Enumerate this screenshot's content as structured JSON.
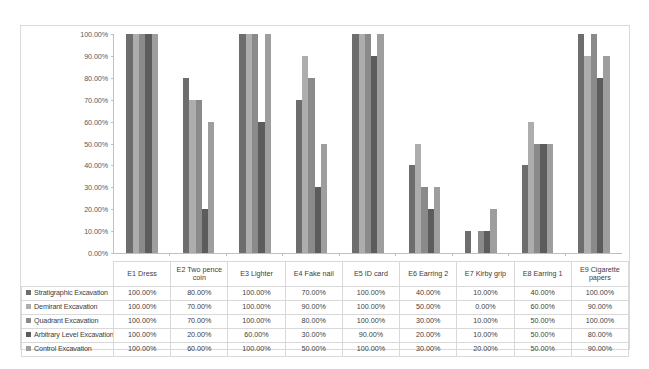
{
  "chart_data": {
    "type": "bar",
    "title": "",
    "xlabel": "",
    "ylabel": "",
    "ylim": [
      0,
      100
    ],
    "ytick_labels": [
      "100.00%",
      "90.00%",
      "80.00%",
      "70.00%",
      "60.00%",
      "50.00%",
      "40.00%",
      "30.00%",
      "20.00%",
      "10.00%",
      "0.00%"
    ],
    "ytick_values": [
      100,
      90,
      80,
      70,
      60,
      50,
      40,
      30,
      20,
      10,
      0
    ],
    "grid": false,
    "legend_position": "data-table-left",
    "value_format": "percent-2dp",
    "categories": [
      "E1 Dress",
      "E2 Two pence coin",
      "E3 Lighter",
      "E4 Fake nail",
      "E5 ID card",
      "E6 Earring 2",
      "E7 Kirby grip",
      "E8 Earring 1",
      "E9 Cigarette papers"
    ],
    "series": [
      {
        "name": "Stratigraphic Excavation",
        "color": "#6d6d6d",
        "values": [
          100,
          80,
          100,
          70,
          100,
          40,
          10,
          40,
          100
        ],
        "labels": [
          "100.00%",
          "80.00%",
          "100.00%",
          "70.00%",
          "100.00%",
          "40.00%",
          "10.00%",
          "40.00%",
          "100.00%"
        ]
      },
      {
        "name": "Demirant Excavation",
        "color": "#adadad",
        "values": [
          100,
          70,
          100,
          90,
          100,
          50,
          0,
          60,
          90
        ],
        "labels": [
          "100.00%",
          "70.00%",
          "100.00%",
          "90.00%",
          "100.00%",
          "50.00%",
          "0.00%",
          "60.00%",
          "90.00%"
        ]
      },
      {
        "name": "Quadrant Excavation",
        "color": "#8a8a8a",
        "values": [
          100,
          70,
          100,
          80,
          100,
          30,
          10,
          50,
          100
        ],
        "labels": [
          "100.00%",
          "70.00%",
          "100.00%",
          "80.00%",
          "100.00%",
          "30.00%",
          "10.00%",
          "50.00%",
          "100.00%"
        ]
      },
      {
        "name": "Arbitrary Level Excavation",
        "color": "#5c5c5c",
        "values": [
          100,
          20,
          60,
          30,
          90,
          20,
          10,
          50,
          80
        ],
        "labels": [
          "100.00%",
          "20.00%",
          "60.00%",
          "30.00%",
          "90.00%",
          "20.00%",
          "10.00%",
          "50.00%",
          "80.00%"
        ]
      },
      {
        "name": "Control Excavation",
        "color": "#9e9e9e",
        "values": [
          100,
          60,
          100,
          50,
          100,
          30,
          20,
          50,
          90
        ],
        "labels": [
          "100.00%",
          "60.00%",
          "100.00%",
          "50.00%",
          "100.00%",
          "30.00%",
          "20.00%",
          "50.00%",
          "90.00%"
        ]
      }
    ]
  }
}
